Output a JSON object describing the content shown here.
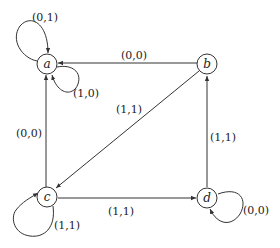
{
  "diagram": {
    "type": "state-transition-graph",
    "nodes": [
      {
        "id": "a",
        "label": "a"
      },
      {
        "id": "b",
        "label": "b"
      },
      {
        "id": "c",
        "label": "c"
      },
      {
        "id": "d",
        "label": "d"
      }
    ],
    "edges": [
      {
        "from": "a",
        "to": "a",
        "label": "(0,1)"
      },
      {
        "from": "a",
        "to": "a",
        "label": "(1,0)"
      },
      {
        "from": "b",
        "to": "a",
        "label": "(0,0)"
      },
      {
        "from": "b",
        "to": "c",
        "label": "(1,1)"
      },
      {
        "from": "c",
        "to": "a",
        "label": "(0,0)"
      },
      {
        "from": "c",
        "to": "c",
        "label": "(1,1)"
      },
      {
        "from": "c",
        "to": "d",
        "label": "(1,1)"
      },
      {
        "from": "d",
        "to": "b",
        "label": "(1,1)"
      },
      {
        "from": "d",
        "to": "d",
        "label": "(0,0)"
      }
    ]
  }
}
